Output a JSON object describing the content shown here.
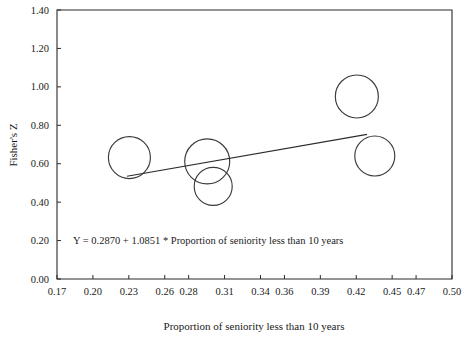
{
  "chart_data": {
    "type": "scatter",
    "title": "",
    "xlabel": "Proportion of seniority less than 10 years",
    "ylabel": "Fisher's Z",
    "xlim": [
      0.17,
      0.5
    ],
    "ylim": [
      0.0,
      1.4
    ],
    "grid": false,
    "legend": null,
    "xticks": [
      "0.17",
      "0.20",
      "0.23",
      "0.26",
      "0.28",
      "0.31",
      "0.34",
      "0.36",
      "0.39",
      "0.42",
      "0.45",
      "0.47",
      "0.50"
    ],
    "xtick_values": [
      0.17,
      0.2,
      0.23,
      0.26,
      0.28,
      0.31,
      0.34,
      0.36,
      0.39,
      0.42,
      0.45,
      0.47,
      0.5
    ],
    "yticks": [
      "0.00",
      "0.20",
      "0.40",
      "0.60",
      "0.80",
      "1.00",
      "1.20",
      "1.40"
    ],
    "ytick_values": [
      0.0,
      0.2,
      0.4,
      0.6,
      0.8,
      1.0,
      1.2,
      1.4
    ],
    "marker": "open-circle",
    "points": [
      {
        "x": 0.2305,
        "y": 0.632,
        "size": 21.0
      },
      {
        "x": 0.2955,
        "y": 0.612,
        "size": 22.5
      },
      {
        "x": 0.3005,
        "y": 0.482,
        "size": 19.0
      },
      {
        "x": 0.4205,
        "y": 0.95,
        "size": 21.5
      },
      {
        "x": 0.4355,
        "y": 0.64,
        "size": 20.0
      }
    ],
    "regression": {
      "intercept": 0.287,
      "slope": 1.0851,
      "x_start": 0.2285,
      "x_end": 0.429,
      "equation": "Y = 0.2870 + 1.0851 * Proportion of seniority less than 10 years"
    }
  },
  "annotations": {
    "equation_label": "Y = 0.2870 + 1.0851 * Proportion of seniority less than 10 years"
  },
  "colors": {
    "axis": "#2b2b2b",
    "bubble_stroke": "#3a3a3a",
    "line": "#2b2b2b",
    "background": "#ffffff",
    "text": "#1a1a1a"
  }
}
